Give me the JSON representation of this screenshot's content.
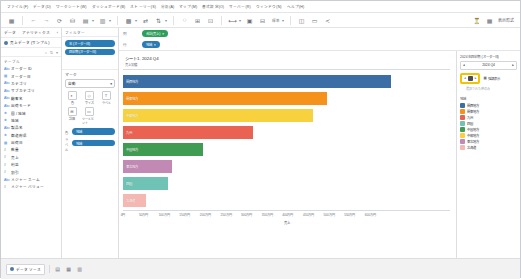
{
  "window": {
    "menu": [
      "データ(D)",
      "分析(A)",
      "マップ(M)",
      "書式設定(O)",
      "サーバー(R)",
      "ウィンドウ(N)",
      "ヘルプ(H)",
      "ワークシート(W)",
      "ダッシュボード(B)",
      "ストーリー(S)",
      "ファイル(F)",
      "表示(V)"
    ],
    "menu_bar": [
      "ファイル(F)",
      "データ(D)",
      "ワークシート(W)",
      "ダッシュボード(B)",
      "ストーリー(S)",
      "分析(A)",
      "マップ(M)",
      "書式設定(O)",
      "サーバー(R)",
      "ウィンドウ(N)",
      "ヘルプ(H)"
    ]
  },
  "toolbar": {
    "items": [
      {
        "name": "tableau-logo-icon",
        "glyph": "▦"
      },
      {
        "name": "back-icon",
        "glyph": "←"
      },
      {
        "name": "forward-icon",
        "glyph": "→"
      },
      {
        "name": "save-icon",
        "glyph": "⟳"
      },
      {
        "name": "new-datasource-icon",
        "glyph": "⛁"
      },
      {
        "name": "new-worksheet-icon",
        "glyph": "▤"
      },
      {
        "name": "duplicate-sheet-icon",
        "glyph": "▥"
      },
      {
        "name": "clear-sheet-icon",
        "glyph": "▩"
      },
      {
        "name": "swap-rows-cols-icon",
        "glyph": "⇄"
      },
      {
        "name": "sort-ascending-icon",
        "glyph": "↑"
      },
      {
        "name": "sort-descending-icon",
        "glyph": "↓"
      },
      {
        "name": "highlight-icon",
        "glyph": "⬚"
      },
      {
        "name": "group-members-icon",
        "glyph": "⊞"
      },
      {
        "name": "show-labels-icon",
        "glyph": "⊡"
      },
      {
        "name": "fix-axes-icon",
        "glyph": "⟷"
      },
      {
        "name": "presentation-mode-icon",
        "glyph": "▷"
      },
      {
        "name": "fit-selector-icon",
        "glyph": "⊟"
      },
      {
        "name": "show-me-icon",
        "glyph": "◫"
      },
      {
        "name": "share-icon",
        "glyph": "≺"
      }
    ],
    "fit_value": "標準",
    "right_label": "表示形式",
    "right_icon": "showme-icon"
  },
  "data_pane": {
    "header": "データ",
    "tab_data": "データ",
    "tab_analytics": "アナリティクス",
    "datasource": "売上データ (サンプル)",
    "search_placeholder": "検索",
    "group_label": "テーブル",
    "fields": [
      {
        "icon": "abc",
        "label": "オーダー ID"
      },
      {
        "icon": "cal",
        "label": "オーダー日"
      },
      {
        "icon": "abc",
        "label": "カテゴリ"
      },
      {
        "icon": "abc",
        "label": "サブカテゴリ"
      },
      {
        "icon": "abc",
        "label": "顧客名"
      },
      {
        "icon": "abc",
        "label": "出荷モード"
      },
      {
        "icon": "geo",
        "label": "国 / 地域"
      },
      {
        "icon": "geo",
        "label": "地域"
      },
      {
        "icon": "abc",
        "label": "製品名"
      },
      {
        "icon": "geo",
        "label": "都道府県"
      },
      {
        "icon": "cal",
        "label": "出荷日"
      },
      {
        "icon": "num",
        "label": "数量"
      },
      {
        "icon": "num",
        "label": "売上"
      },
      {
        "icon": "num",
        "label": "利益"
      },
      {
        "icon": "num",
        "label": "割引"
      },
      {
        "icon": "abc",
        "label": "メジャー ネーム"
      },
      {
        "icon": "num",
        "label": "メジャー バリュー"
      }
    ]
  },
  "marks_panel": {
    "filters_title": "フィルター",
    "filters": [
      {
        "label": "年 (オーダー日)"
      },
      {
        "label": "四半期 (オーダー日)"
      }
    ],
    "marks_title": "マーク",
    "mark_type": "自動",
    "buttons": [
      {
        "name": "color-button",
        "glyph": "◐",
        "label": "色"
      },
      {
        "name": "size-button",
        "glyph": "◇",
        "label": "サイズ"
      },
      {
        "name": "label-button",
        "glyph": "T",
        "label": "ラベル"
      },
      {
        "name": "detail-button",
        "glyph": "⊞",
        "label": "詳細"
      },
      {
        "name": "tooltip-button",
        "glyph": "▭",
        "label": "ツールヒント"
      }
    ],
    "pills": [
      {
        "lead": "色",
        "label": "地域",
        "color": "blue"
      },
      {
        "lead": "ラベル",
        "label": "地域",
        "color": "blue"
      }
    ]
  },
  "shelves": {
    "filters_label": "フィルター",
    "pages_label": "ページ",
    "columns_label": "列",
    "rows_label": "行",
    "column_pills": [
      {
        "label": "合計(売上)",
        "color": "green"
      }
    ],
    "row_pills": [
      {
        "label": "地域",
        "color": "blue"
      }
    ]
  },
  "viz": {
    "title": "シート1. 2024 Q4",
    "subtitle": "売上実績",
    "axis_title": "売上"
  },
  "filter_card": {
    "title": "2024 年四半期 (オーダー日)",
    "selected_quarter": "2024 Q4",
    "highlight_label": "強調表示",
    "highlight_note": "選択された値のみ"
  },
  "legend": {
    "title": "地域",
    "items": [
      {
        "label": "関西地方",
        "color": "#3b6ea5"
      },
      {
        "label": "関東地方",
        "color": "#f5921b"
      },
      {
        "label": "九州",
        "color": "#ea6252"
      },
      {
        "label": "四国",
        "color": "#6ec3b4"
      },
      {
        "label": "中国地方",
        "color": "#3f9c52"
      },
      {
        "label": "中部地方",
        "color": "#f7d githubusercontent"
      },
      {
        "label": "東北地方",
        "color": "#c389b5"
      },
      {
        "label": "北海道",
        "color": "#f5b7b1"
      }
    ]
  },
  "status_bar": {
    "tabs": [
      {
        "label": "データ ソース",
        "icon": "datasource-icon"
      }
    ],
    "sheet_icons": [
      {
        "name": "new-worksheet-icon",
        "glyph": "▤"
      },
      {
        "name": "new-dashboard-icon",
        "glyph": "▦"
      },
      {
        "name": "new-story-icon",
        "glyph": "▥"
      }
    ]
  },
  "chart_data": {
    "type": "bar",
    "orientation": "horizontal",
    "title": "シート1. 2024 Q4",
    "xlabel": "売上",
    "ylabel": "地域",
    "categories": [
      "関西地方",
      "関東地方",
      "中部地方",
      "九州",
      "中国地方",
      "東北地方",
      "四国",
      "北海道"
    ],
    "values": [
      6500000,
      4950000,
      4600000,
      3150000,
      1950000,
      1180000,
      1100000,
      550000
    ],
    "colors": [
      "#3b6ea5",
      "#f5921b",
      "#f7d23e",
      "#ea6252",
      "#3f9c52",
      "#c389b5",
      "#6ec3b4",
      "#f5b7b1"
    ],
    "xlim": [
      0,
      6500000
    ],
    "ticks": [
      {
        "value": 0,
        "label": "0円"
      },
      {
        "value": 500000,
        "label": "50万円"
      },
      {
        "value": 1000000,
        "label": "100万円"
      },
      {
        "value": 1500000,
        "label": "150万円"
      },
      {
        "value": 2000000,
        "label": "200万円"
      },
      {
        "value": 2500000,
        "label": "250万円"
      },
      {
        "value": 3000000,
        "label": "300万円"
      },
      {
        "value": 3500000,
        "label": "350万円"
      },
      {
        "value": 4000000,
        "label": "400万円"
      },
      {
        "value": 4500000,
        "label": "450万円"
      },
      {
        "value": 5000000,
        "label": "500万円"
      },
      {
        "value": 5500000,
        "label": "550万円"
      },
      {
        "value": 6000000,
        "label": "600万円"
      }
    ],
    "grid": false,
    "legend_position": "right"
  }
}
